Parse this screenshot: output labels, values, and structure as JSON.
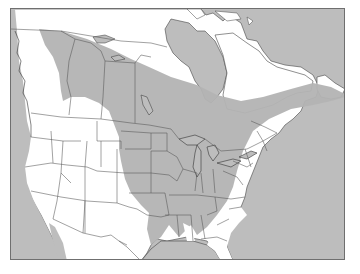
{
  "map": {
    "title": "",
    "region": "North America",
    "colors": {
      "water": "#bdbdbd",
      "land": "#ffffff",
      "range": "#b3b3b3",
      "borders": "#555555",
      "frame": "#6f6f6f"
    },
    "layers": [
      {
        "name": "land",
        "description": "Canada, United States, northern Mexico"
      },
      {
        "name": "range",
        "description": "Shaded species range: north-western Canada boreal band extending east across Hudson Bay region to Labrador/Newfoundland, and south across central and eastern United States to the Gulf states"
      },
      {
        "name": "borders",
        "description": "State and provincial boundaries"
      }
    ],
    "legend": []
  }
}
